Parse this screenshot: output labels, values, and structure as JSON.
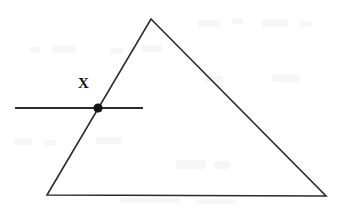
{
  "figure": {
    "kind": "geometry-diagram",
    "background_color": "#ffffff",
    "stroke_color": "#2b2b2b",
    "ink_color": "#141414",
    "width": 347,
    "height": 209,
    "labels": [
      {
        "id": "x",
        "text": "X",
        "x": 84,
        "y": 83
      }
    ],
    "shapes": {
      "triangle": {
        "name": "triangle",
        "vertices": [
          {
            "x": 151,
            "y": 19
          },
          {
            "x": 326,
            "y": 196
          },
          {
            "x": 47,
            "y": 195
          }
        ],
        "stroke_width": 1.6,
        "filled": false
      },
      "secant_line": {
        "name": "horizontal-line",
        "x1": 15,
        "y1": 108,
        "x2": 143,
        "y2": 108,
        "stroke_width": 2.2
      },
      "marked_point": {
        "name": "intersection-point",
        "cx": 98,
        "cy": 108,
        "r": 4.6,
        "label": "X"
      }
    }
  }
}
